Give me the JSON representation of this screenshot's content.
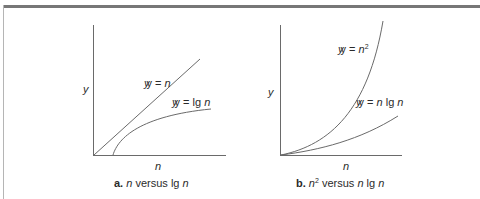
{
  "figure": {
    "panels": [
      {
        "id": "a",
        "y_axis_label": "y",
        "x_axis_label": "n",
        "curves": [
          {
            "name": "linear",
            "label_prefix": "y = ",
            "label_var": "n",
            "label_sup": ""
          },
          {
            "name": "logarithmic",
            "label_prefix": "y = lg ",
            "label_var": "n",
            "label_sup": ""
          }
        ],
        "caption": {
          "letter": "a.",
          "v1": "n",
          "sup1": "",
          "mid": " versus lg ",
          "v2": "n"
        }
      },
      {
        "id": "b",
        "y_axis_label": "y",
        "x_axis_label": "n",
        "curves": [
          {
            "name": "quadratic",
            "label_prefix": "y = ",
            "label_var": "n",
            "label_sup": "2"
          },
          {
            "name": "n-log-n",
            "label_prefix": "y = ",
            "label_var": "n",
            "label_mid": " lg ",
            "label_var2": "n"
          }
        ],
        "caption": {
          "letter": "b.",
          "v1": "n",
          "sup1": "2",
          "mid": " versus ",
          "v2": "n",
          "tail": " lg ",
          "v3": "n"
        }
      }
    ]
  },
  "colors": {
    "axis": "#6a6a6a",
    "curve": "#6a6a6a",
    "topbar": "#777777"
  }
}
